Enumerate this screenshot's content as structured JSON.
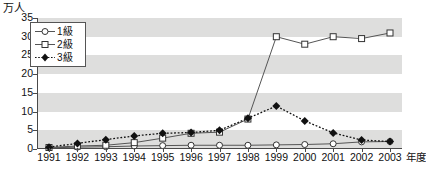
{
  "chart_data": {
    "type": "line",
    "title": "",
    "unit_label": "万人",
    "ylabel": "万人",
    "xlabel": "年度",
    "xaxis_suffix": "年度",
    "categories": [
      "1991",
      "1992",
      "1993",
      "1994",
      "1995",
      "1996",
      "1997",
      "1998",
      "1999",
      "2000",
      "2001",
      "2002",
      "2003"
    ],
    "ylim": [
      0,
      35
    ],
    "yticks": [
      0,
      5,
      10,
      15,
      20,
      25,
      30,
      35
    ],
    "ytick_labels": [
      "0",
      "5",
      "10",
      "15",
      "20",
      "25",
      "30",
      "35"
    ],
    "grid": false,
    "banding": "alternating horizontal gray bands every 5 units",
    "legend_position": "top-left inside plot",
    "series": [
      {
        "name": "1級",
        "marker": "open-circle",
        "line_style": "solid",
        "color": "#555555",
        "values": [
          0.3,
          0.5,
          0.6,
          0.8,
          0.9,
          1.0,
          1.0,
          1.0,
          1.1,
          1.2,
          1.4,
          1.9,
          2.0
        ]
      },
      {
        "name": "2級",
        "marker": "open-square",
        "line_style": "solid",
        "color": "#555555",
        "values": [
          0.4,
          0.8,
          1.0,
          1.7,
          2.9,
          4.2,
          4.5,
          8.0,
          30.0,
          28.0,
          30.0,
          29.5,
          31.0
        ]
      },
      {
        "name": "3級",
        "marker": "filled-diamond",
        "line_style": "dotted",
        "color": "#111111",
        "values": [
          0.5,
          1.5,
          2.5,
          3.5,
          4.2,
          4.4,
          5.0,
          8.2,
          11.5,
          7.5,
          4.3,
          2.4,
          2.0
        ]
      }
    ]
  },
  "legend": {
    "items": [
      {
        "label": "1級",
        "marker": "open-circle"
      },
      {
        "label": "2級",
        "marker": "open-square"
      },
      {
        "label": "3級",
        "marker": "filled-diamond"
      }
    ]
  }
}
